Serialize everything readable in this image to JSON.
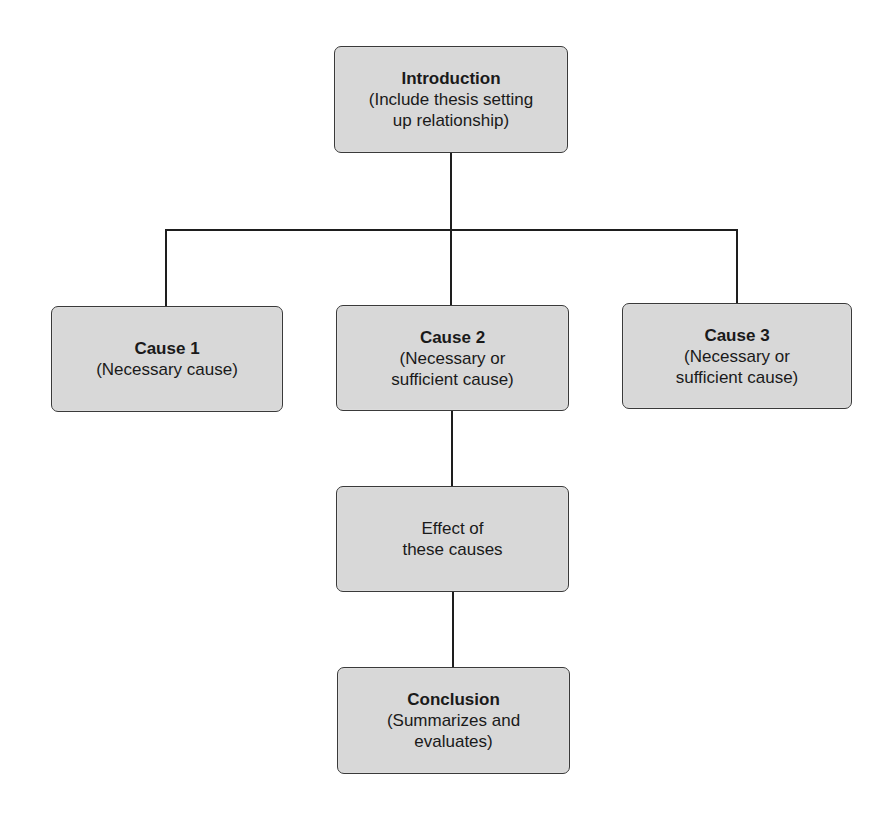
{
  "diagram": {
    "type": "flowchart",
    "nodes": {
      "introduction": {
        "title": "Introduction",
        "desc": "(Include thesis setting\nup relationship)"
      },
      "cause1": {
        "title": "Cause 1",
        "desc": "(Necessary cause)"
      },
      "cause2": {
        "title": "Cause 2",
        "desc": "(Necessary or\nsufficient cause)"
      },
      "cause3": {
        "title": "Cause 3",
        "desc": "(Necessary or\nsufficient cause)"
      },
      "effect": {
        "title": "",
        "desc": "Effect of\nthese causes"
      },
      "conclusion": {
        "title": "Conclusion",
        "desc": "(Summarizes and\nevaluates)"
      }
    },
    "edges": [
      {
        "from": "introduction",
        "to": "cause1"
      },
      {
        "from": "introduction",
        "to": "cause2"
      },
      {
        "from": "introduction",
        "to": "cause3"
      },
      {
        "from": "cause2",
        "to": "effect"
      },
      {
        "from": "effect",
        "to": "conclusion"
      }
    ],
    "colors": {
      "box_fill": "#d8d8d8",
      "box_border": "#3a3a3a",
      "connector": "#1e1e1e"
    }
  }
}
